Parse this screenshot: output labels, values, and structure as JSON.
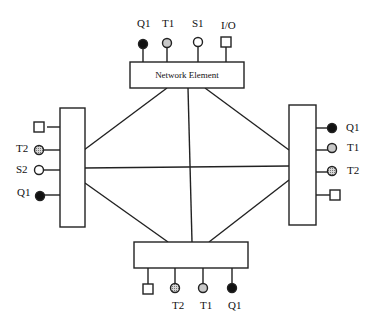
{
  "diagram": {
    "type": "network-topology",
    "center_element": {
      "label": "Network Element"
    },
    "top": {
      "ports": [
        {
          "label": "Q1",
          "symbol": "filled-circle"
        },
        {
          "label": "T1",
          "symbol": "shaded-circle"
        },
        {
          "label": "S1",
          "symbol": "open-circle"
        },
        {
          "label": "I/O",
          "symbol": "square"
        }
      ]
    },
    "left": {
      "ports": [
        {
          "label": "",
          "symbol": "square"
        },
        {
          "label": "T2",
          "symbol": "hatched-circle"
        },
        {
          "label": "S2",
          "symbol": "open-circle"
        },
        {
          "label": "Q1",
          "symbol": "filled-circle"
        }
      ]
    },
    "right": {
      "ports": [
        {
          "label": "Q1",
          "symbol": "filled-circle"
        },
        {
          "label": "T1",
          "symbol": "shaded-circle"
        },
        {
          "label": "T2",
          "symbol": "hatched-circle"
        },
        {
          "label": "",
          "symbol": "square"
        }
      ]
    },
    "bottom": {
      "ports": [
        {
          "label": "",
          "symbol": "square"
        },
        {
          "label": "T2",
          "symbol": "hatched-circle"
        },
        {
          "label": "T1",
          "symbol": "shaded-circle"
        },
        {
          "label": "Q1",
          "symbol": "filled-circle"
        }
      ]
    },
    "links": [
      [
        "top",
        "left"
      ],
      [
        "top",
        "bottom"
      ],
      [
        "top",
        "right"
      ],
      [
        "left",
        "right"
      ],
      [
        "left",
        "bottom"
      ],
      [
        "right",
        "bottom"
      ]
    ],
    "colors": {
      "line": "#222222",
      "filled": "#111111",
      "shaded": "#c8c8c8",
      "hatched": "#9a9a9a",
      "open": "#ffffff"
    }
  }
}
